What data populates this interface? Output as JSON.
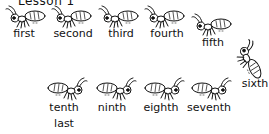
{
  "title": "Lesson 1",
  "ants": [
    {
      "label": "first"
    },
    {
      "label": "second"
    },
    {
      "label": "third"
    },
    {
      "label": "fourth"
    },
    {
      "label": "fifth"
    },
    {
      "label": "sixth"
    },
    {
      "label": "seventh"
    },
    {
      "label": "eighth"
    },
    {
      "label": "ninth"
    },
    {
      "label": "tenth"
    }
  ],
  "extra_label": "last"
}
